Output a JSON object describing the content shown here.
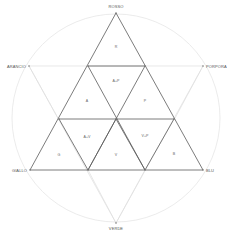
{
  "diagram": {
    "vertices": {
      "top": "ROSSO",
      "upper_left": "ARANCIO",
      "upper_right": "PORPORA",
      "lower_left": "GIALLO",
      "lower_right": "BLU",
      "bottom": "VERDE"
    },
    "triangles": {
      "top": "R",
      "center_top": "A+P",
      "left": "A",
      "right": "P",
      "bottom_left": "G",
      "bottom_left_inner": "A+V",
      "bottom_center": "V",
      "bottom_right_inner": "V+P",
      "bottom_right": "B"
    },
    "colors": {
      "line": "#5a5a5a",
      "guide": "#dddddd",
      "text": "#555555"
    }
  }
}
